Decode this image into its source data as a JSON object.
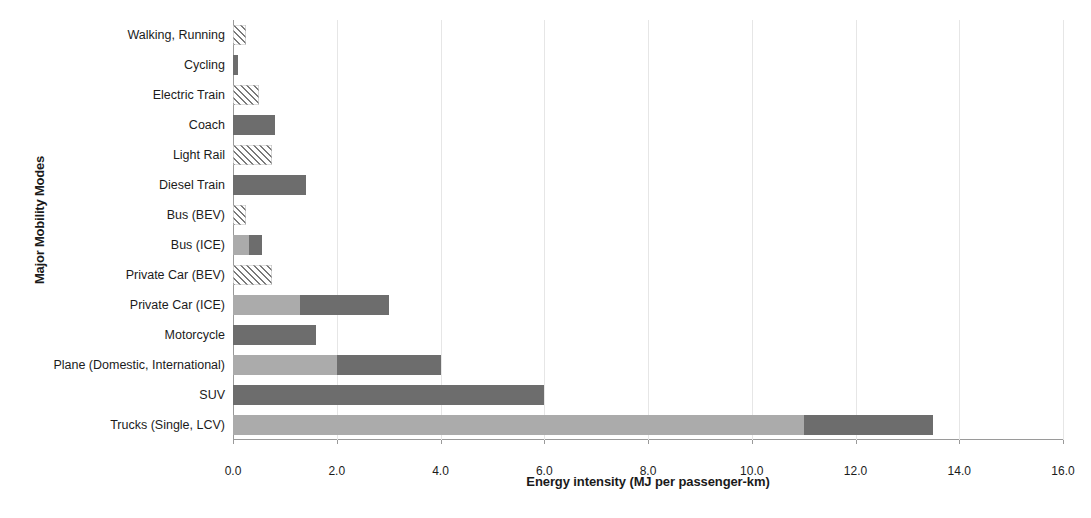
{
  "chart_data": {
    "type": "bar",
    "orientation": "horizontal",
    "stacked": true,
    "title": "",
    "xlabel": "Energy intensity (MJ per passenger-km)",
    "ylabel": "Major Mobility Modes",
    "xlim": [
      0.0,
      16.0
    ],
    "xticks": [
      "0.0",
      "2.0",
      "4.0",
      "6.0",
      "8.0",
      "10.0",
      "12.0",
      "14.0",
      "16.0"
    ],
    "xtick_values": [
      0,
      2,
      4,
      6,
      8,
      10,
      12,
      14,
      16
    ],
    "grid": "vertical-light",
    "legend": "none",
    "categories": [
      "Walking, Running",
      "Cycling",
      "Electric Train",
      "Coach",
      "Light Rail",
      "Diesel Train",
      "Bus (BEV)",
      "Bus (ICE)",
      "Private Car (BEV)",
      "Private Car (ICE)",
      "Motorcycle",
      "Plane (Domestic, International)",
      "SUV",
      "Trucks (Single, LCV)"
    ],
    "series": [
      {
        "name": "low estimate",
        "style": "light-or-hatched",
        "values": [
          0.25,
          0.1,
          0.5,
          0.8,
          0.75,
          1.4,
          0.25,
          0.3,
          0.75,
          1.3,
          1.6,
          2.0,
          6.0,
          11.0
        ]
      },
      {
        "name": "high estimate (additional range)",
        "style": "dark",
        "values": [
          0.0,
          0.0,
          0.0,
          0.0,
          0.0,
          0.0,
          0.0,
          0.25,
          0.0,
          1.7,
          0.0,
          2.0,
          0.0,
          2.5
        ]
      }
    ],
    "totals": [
      0.25,
      0.1,
      0.5,
      0.8,
      0.75,
      1.4,
      0.25,
      0.55,
      0.75,
      3.0,
      1.6,
      4.0,
      6.0,
      13.5
    ],
    "bars": [
      {
        "label": "Walking, Running",
        "segments": [
          {
            "from": 0.0,
            "to": 0.25,
            "fill": "hatch"
          }
        ]
      },
      {
        "label": "Cycling",
        "segments": [
          {
            "from": 0.0,
            "to": 0.1,
            "fill": "solid-dark"
          }
        ]
      },
      {
        "label": "Electric Train",
        "segments": [
          {
            "from": 0.0,
            "to": 0.5,
            "fill": "hatch"
          }
        ]
      },
      {
        "label": "Coach",
        "segments": [
          {
            "from": 0.0,
            "to": 0.8,
            "fill": "solid-dark"
          }
        ]
      },
      {
        "label": "Light Rail",
        "segments": [
          {
            "from": 0.0,
            "to": 0.75,
            "fill": "hatch"
          }
        ]
      },
      {
        "label": "Diesel Train",
        "segments": [
          {
            "from": 0.0,
            "to": 1.4,
            "fill": "solid-dark"
          }
        ]
      },
      {
        "label": "Bus (BEV)",
        "segments": [
          {
            "from": 0.0,
            "to": 0.25,
            "fill": "hatch"
          }
        ]
      },
      {
        "label": "Bus (ICE)",
        "segments": [
          {
            "from": 0.0,
            "to": 0.3,
            "fill": "solid-light"
          },
          {
            "from": 0.3,
            "to": 0.55,
            "fill": "solid-dark"
          }
        ]
      },
      {
        "label": "Private Car (BEV)",
        "segments": [
          {
            "from": 0.0,
            "to": 0.75,
            "fill": "hatch"
          }
        ]
      },
      {
        "label": "Private Car (ICE)",
        "segments": [
          {
            "from": 0.0,
            "to": 1.3,
            "fill": "solid-light"
          },
          {
            "from": 1.3,
            "to": 3.0,
            "fill": "solid-dark"
          }
        ]
      },
      {
        "label": "Motorcycle",
        "segments": [
          {
            "from": 0.0,
            "to": 1.6,
            "fill": "solid-dark"
          }
        ]
      },
      {
        "label": "Plane (Domestic, International)",
        "segments": [
          {
            "from": 0.0,
            "to": 2.0,
            "fill": "solid-light"
          },
          {
            "from": 2.0,
            "to": 4.0,
            "fill": "solid-dark"
          }
        ]
      },
      {
        "label": "SUV",
        "segments": [
          {
            "from": 0.0,
            "to": 6.0,
            "fill": "solid-dark"
          }
        ]
      },
      {
        "label": "Trucks (Single, LCV)",
        "segments": [
          {
            "from": 0.0,
            "to": 11.0,
            "fill": "solid-light"
          },
          {
            "from": 11.0,
            "to": 13.5,
            "fill": "solid-dark"
          }
        ]
      }
    ],
    "colors": {
      "dark": "#6d6d6d",
      "light": "#ababab",
      "hatch_line": "#7a7a7a",
      "gridline": "#e6e6e6",
      "axis": "#9a9a9a",
      "text": "#1b1b1b"
    }
  }
}
